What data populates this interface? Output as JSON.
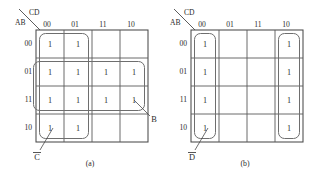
{
  "figure": {
    "background_color": "#ffffff",
    "line_color": "#5a5a5a",
    "loop_color": "#6e6e6e",
    "text_color": "#2b2b2b"
  },
  "maps": [
    {
      "id": "a",
      "caption": "(a)",
      "corner": {
        "top_label": "CD",
        "bottom_label": "AB"
      },
      "column_headers": [
        "00",
        "01",
        "11",
        "10"
      ],
      "row_headers": [
        "00",
        "01",
        "11",
        "10"
      ],
      "cells": [
        [
          "1",
          "1",
          "",
          ""
        ],
        [
          "1",
          "1",
          "1",
          "1"
        ],
        [
          "1",
          "1",
          "1",
          "1"
        ],
        [
          "1",
          "1",
          "",
          ""
        ]
      ],
      "groups": [
        {
          "name": "vertical-group",
          "label": "C",
          "label_overline": true,
          "covers_rows": [
            "00",
            "01",
            "11",
            "10"
          ],
          "covers_cols": [
            "00",
            "01"
          ]
        },
        {
          "name": "horizontal-group",
          "label": "B",
          "label_overline": false,
          "covers_rows": [
            "01",
            "11"
          ],
          "covers_cols": [
            "00",
            "01",
            "11",
            "10"
          ]
        }
      ]
    },
    {
      "id": "b",
      "caption": "(b)",
      "corner": {
        "top_label": "CD",
        "bottom_label": "AB"
      },
      "column_headers": [
        "00",
        "01",
        "11",
        "10"
      ],
      "row_headers": [
        "00",
        "01",
        "11",
        "10"
      ],
      "cells": [
        [
          "1",
          "",
          "",
          "1"
        ],
        [
          "1",
          "",
          "",
          "1"
        ],
        [
          "1",
          "",
          "",
          "1"
        ],
        [
          "1",
          "",
          "",
          "1"
        ]
      ],
      "groups": [
        {
          "name": "left-column-group",
          "label": "D",
          "label_overline": true,
          "covers_rows": [
            "00",
            "01",
            "11",
            "10"
          ],
          "covers_cols": [
            "00"
          ]
        },
        {
          "name": "right-column-group",
          "label": "",
          "label_overline": false,
          "covers_rows": [
            "00",
            "01",
            "11",
            "10"
          ],
          "covers_cols": [
            "10"
          ]
        }
      ]
    }
  ]
}
